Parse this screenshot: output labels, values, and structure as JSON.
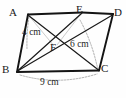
{
  "figure": {
    "kind": "geometry-diagram",
    "shape": "parallelogram",
    "caption": "Parallelogram ABCD with point E on AD and diagonals meeting at F",
    "stroke_color": "#141414",
    "thin_stroke_color": "#8a8a8a",
    "background_color": "#fefefe",
    "vertices": [
      {
        "id": "A",
        "label": "A",
        "x": 28,
        "y": 14
      },
      {
        "id": "E",
        "label": "E",
        "x": 82,
        "y": 12
      },
      {
        "id": "D",
        "label": "D",
        "x": 113,
        "y": 14
      },
      {
        "id": "B",
        "label": "B",
        "x": 17,
        "y": 72
      },
      {
        "id": "C",
        "label": "C",
        "x": 99,
        "y": 71
      },
      {
        "id": "F",
        "label": "F",
        "x": 55,
        "y": 48
      }
    ],
    "solid_edges": [
      {
        "name": "edge-AE",
        "from": "A",
        "to": "E"
      },
      {
        "name": "edge-ED",
        "from": "E",
        "to": "D"
      },
      {
        "name": "edge-AB",
        "from": "A",
        "to": "B"
      },
      {
        "name": "edge-BC",
        "from": "B",
        "to": "C"
      },
      {
        "name": "edge-CD",
        "from": "C",
        "to": "D"
      },
      {
        "name": "diagonal-AC",
        "from": "A",
        "to": "C"
      },
      {
        "name": "diagonal-BD",
        "from": "B",
        "to": "D"
      },
      {
        "name": "segment-BE",
        "from": "B",
        "to": "E"
      }
    ],
    "measurement_lines": [
      {
        "name": "height-from-A",
        "x1": 29,
        "y1": 17,
        "x2": 27,
        "y2": 48
      },
      {
        "name": "height-to-C",
        "x1": 80,
        "y1": 20,
        "x2": 97,
        "y2": 68
      },
      {
        "name": "base-arc-BC",
        "x1": 20,
        "y1": 76,
        "x2": 97,
        "y2": 75
      }
    ],
    "measurements": [
      {
        "name": "measure-4cm",
        "value": "4 cm",
        "refers_to": "height-from-A"
      },
      {
        "name": "measure-6cm",
        "value": "6 cm",
        "refers_to": "height-to-C"
      },
      {
        "name": "measure-9cm",
        "value": "9 cm",
        "refers_to": "base-arc-BC"
      }
    ]
  }
}
